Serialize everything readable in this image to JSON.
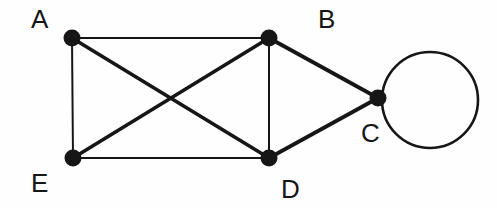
{
  "diagram": {
    "background_color": "#fefefe",
    "ink_color": "#161616",
    "canvas": {
      "width": 497,
      "height": 208
    },
    "vertices": [
      {
        "id": "A",
        "label": "A",
        "cx": 72,
        "cy": 38,
        "r": 8.5,
        "label_x": 31,
        "label_y": 6,
        "fill": "#161616"
      },
      {
        "id": "B",
        "label": "B",
        "cx": 269,
        "cy": 38,
        "r": 8.5,
        "label_x": 318,
        "label_y": 6,
        "fill": "#161616"
      },
      {
        "id": "C",
        "label": "C",
        "cx": 378,
        "cy": 98,
        "r": 8.5,
        "label_x": 361,
        "label_y": 120,
        "fill": "#161616"
      },
      {
        "id": "D",
        "label": "D",
        "cx": 269,
        "cy": 158,
        "r": 8.5,
        "label_x": 281,
        "label_y": 176,
        "fill": "#161616"
      },
      {
        "id": "E",
        "label": "E",
        "cx": 73,
        "cy": 158,
        "r": 8.5,
        "label_x": 31,
        "label_y": 170,
        "fill": "#161616"
      }
    ],
    "edges": [
      {
        "id": "A-B",
        "from": "A",
        "to": "B",
        "x1": 72,
        "y1": 38,
        "x2": 269,
        "y2": 38,
        "width": 2.0,
        "style": "thin"
      },
      {
        "id": "A-E",
        "from": "A",
        "to": "E",
        "x1": 72,
        "y1": 38,
        "x2": 73,
        "y2": 158,
        "width": 2.0,
        "style": "thin"
      },
      {
        "id": "B-D",
        "from": "B",
        "to": "D",
        "x1": 269,
        "y1": 38,
        "x2": 269,
        "y2": 158,
        "width": 2.0,
        "style": "thin"
      },
      {
        "id": "E-D",
        "from": "E",
        "to": "D",
        "x1": 73,
        "y1": 158,
        "x2": 269,
        "y2": 158,
        "width": 2.0,
        "style": "thin"
      },
      {
        "id": "A-D",
        "from": "A",
        "to": "D",
        "x1": 72,
        "y1": 38,
        "x2": 269,
        "y2": 158,
        "width": 3.6,
        "style": "thick"
      },
      {
        "id": "E-B",
        "from": "E",
        "to": "B",
        "x1": 73,
        "y1": 158,
        "x2": 269,
        "y2": 38,
        "width": 3.6,
        "style": "thick"
      },
      {
        "id": "B-C",
        "from": "B",
        "to": "C",
        "x1": 269,
        "y1": 38,
        "x2": 378,
        "y2": 98,
        "width": 3.8,
        "style": "thick"
      },
      {
        "id": "D-C",
        "from": "D",
        "to": "C",
        "x1": 269,
        "y1": 158,
        "x2": 378,
        "y2": 98,
        "width": 3.8,
        "style": "thick"
      }
    ],
    "self_loops": [
      {
        "id": "C-C",
        "at": "C",
        "cx": 430,
        "cy": 100,
        "r": 48,
        "width": 2.6,
        "style": "thin"
      }
    ]
  }
}
